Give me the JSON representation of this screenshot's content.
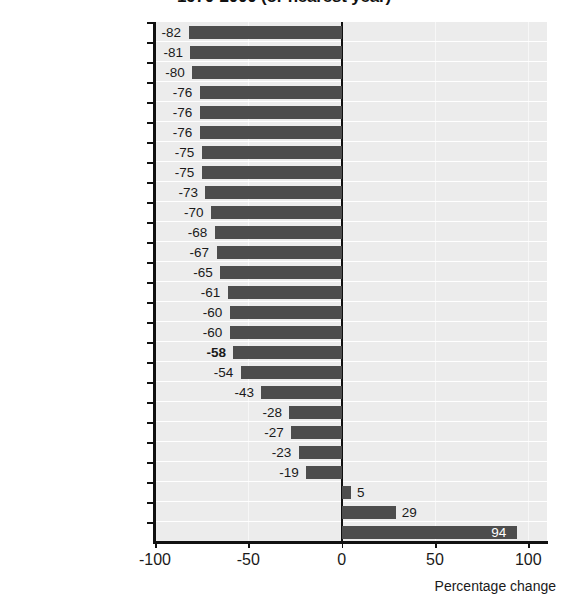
{
  "chart_data": {
    "type": "bar",
    "orientation": "horizontal",
    "title": "1970-2000 (or nearest year)",
    "xlabel": "Percentage change",
    "ylabel": "",
    "xlim": [
      -100,
      110
    ],
    "xticks": [
      -100,
      -50,
      0,
      50,
      100
    ],
    "xtick_labels": [
      "-100",
      "-50",
      "0",
      "50",
      "100"
    ],
    "grid": "horizontal-banded",
    "legend": "none",
    "bar_color": "#4d4d4d",
    "plot_background": "#ececec",
    "zero_line_color": "#111111",
    "highlighted_category": "OECD",
    "categories": [
      "Netherlands",
      "Germany",
      "Switzerland",
      "Australia",
      "Denmark",
      "Japan",
      "Austria",
      "Luxembourg",
      "Finland",
      "Sweden",
      "France",
      "Norway",
      "Canada",
      "United Kingdom",
      "Italy",
      "Ireland",
      "OECD",
      "New Zealand",
      "United States",
      "Iceland",
      "Spain",
      "Portugal",
      "Hungary",
      "Poland",
      "Greece",
      "Mexico"
    ],
    "values": [
      -82,
      -81,
      -80,
      -76,
      -76,
      -76,
      -75,
      -75,
      -73,
      -70,
      -68,
      -67,
      -65,
      -61,
      -60,
      -60,
      -58,
      -54,
      -43,
      -28,
      -27,
      -23,
      -19,
      5,
      29,
      94
    ],
    "value_labels": [
      "-82",
      "-81",
      "-80",
      "-76",
      "-76",
      "-76",
      "-75",
      "-75",
      "-73",
      "-70",
      "-68",
      "-67",
      "-65",
      "-61",
      "-60",
      "-60",
      "-58",
      "-54",
      "-43",
      "-28",
      "-27",
      "-23",
      "-19",
      "5",
      "29",
      "94"
    ]
  }
}
